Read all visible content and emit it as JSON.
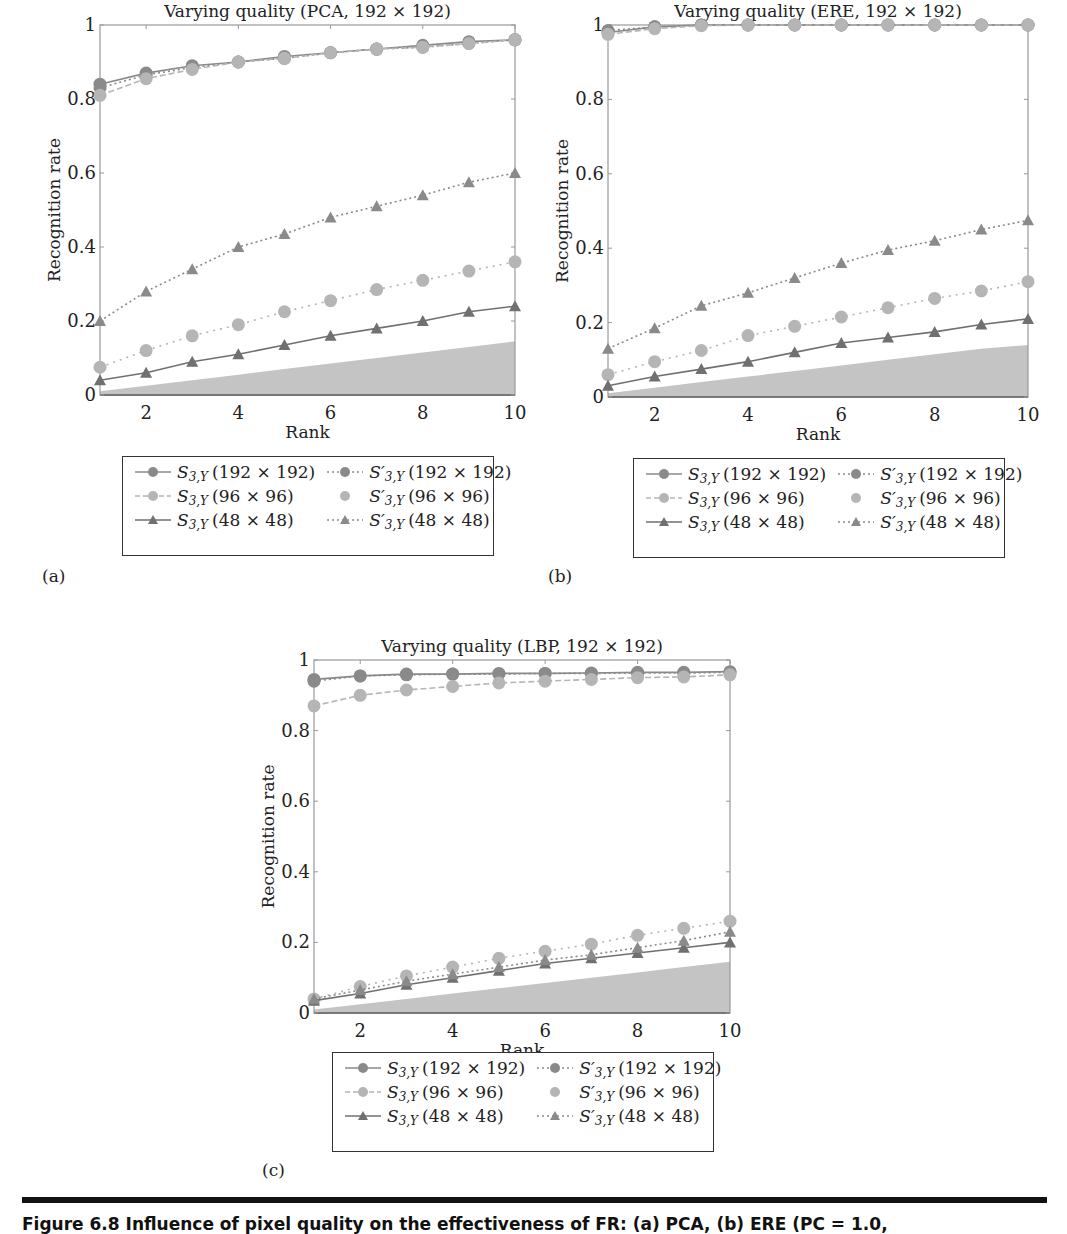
{
  "figure": {
    "caption": "Figure 6.8   Influence of pixel quality on the effectiveness of FR: (a) PCA, (b) ERE (PC = 1.0,",
    "rule_color": "#111111"
  },
  "panels": [
    {
      "id": "a",
      "label": "(a)",
      "title": "Varying quality (PCA, 192 × 192)",
      "xlabel": "Rank",
      "ylabel": "Recognition rate",
      "xticks": [
        "2",
        "4",
        "6",
        "8",
        "10"
      ],
      "yticks": [
        "0",
        "0.2",
        "0.4",
        "0.6",
        "0.8",
        "1"
      ]
    },
    {
      "id": "b",
      "label": "(b)",
      "title": "Varying quality (ERE, 192 × 192)",
      "xlabel": "Rank",
      "ylabel": "Recognition rate",
      "xticks": [
        "2",
        "4",
        "6",
        "8",
        "10"
      ],
      "yticks": [
        "0",
        "0.2",
        "0.4",
        "0.6",
        "0.8",
        "1"
      ]
    },
    {
      "id": "c",
      "label": "(c)",
      "title": "Varying quality (LBP, 192 × 192)",
      "xlabel": "Rank",
      "ylabel": "Recognition rate",
      "xticks": [
        "2",
        "4",
        "6",
        "8",
        "10"
      ],
      "yticks": [
        "0",
        "0.2",
        "0.4",
        "0.6",
        "0.8",
        "1"
      ]
    }
  ],
  "legend": {
    "items": [
      {
        "base": "S",
        "sub": "3,Y",
        "prime": "",
        "size": "(192 × 192)",
        "marker": "circle",
        "line": "solid",
        "color": "#8a8a8a"
      },
      {
        "base": "S",
        "sub": "3,Y",
        "prime": "′",
        "size": "(192 × 192)",
        "marker": "circle",
        "line": "dotted",
        "color": "#8a8a8a"
      },
      {
        "base": "S",
        "sub": "3,Y",
        "prime": "",
        "size": "(96 × 96)",
        "marker": "circle",
        "line": "dashed",
        "color": "#b5b5b5"
      },
      {
        "base": "S",
        "sub": "3,Y",
        "prime": "′",
        "size": "(96 × 96)",
        "marker": "circle",
        "line": "none",
        "color": "#b5b5b5"
      },
      {
        "base": "S",
        "sub": "3,Y",
        "prime": "",
        "size": "(48 × 48)",
        "marker": "triangle",
        "line": "solid",
        "color": "#707070"
      },
      {
        "base": "S",
        "sub": "3,Y",
        "prime": "′",
        "size": "(48 × 48)",
        "marker": "triangle",
        "line": "dotted",
        "color": "#8a8a8a"
      }
    ]
  },
  "chart_data": [
    {
      "type": "line",
      "title": "Varying quality (PCA, 192 × 192)",
      "xlabel": "Rank",
      "ylabel": "Recognition rate",
      "x": [
        1,
        2,
        3,
        4,
        5,
        6,
        7,
        8,
        9,
        10
      ],
      "xlim": [
        1,
        10
      ],
      "ylim": [
        0,
        1
      ],
      "xticks": [
        2,
        4,
        6,
        8,
        10
      ],
      "yticks": [
        0,
        0.2,
        0.4,
        0.6,
        0.8,
        1
      ],
      "grid": false,
      "legend_position": "below",
      "series": [
        {
          "name": "S3,Y (192×192)",
          "values": [
            0.84,
            0.87,
            0.89,
            0.9,
            0.915,
            0.925,
            0.935,
            0.945,
            0.955,
            0.96
          ]
        },
        {
          "name": "S3,Y (96×96)",
          "values": [
            0.83,
            0.865,
            0.885,
            0.9,
            0.91,
            0.925,
            0.935,
            0.94,
            0.95,
            0.96
          ]
        },
        {
          "name": "S3,Y (48×48)",
          "values": [
            0.81,
            0.855,
            0.88,
            0.9,
            0.91,
            0.925,
            0.935,
            0.94,
            0.95,
            0.96
          ]
        },
        {
          "name": "S'3,Y (192×192)",
          "values": [
            0.075,
            0.12,
            0.16,
            0.19,
            0.225,
            0.255,
            0.285,
            0.31,
            0.335,
            0.36
          ]
        },
        {
          "name": "S'3,Y (96×96)",
          "values": [
            0.04,
            0.06,
            0.09,
            0.11,
            0.135,
            0.16,
            0.18,
            0.2,
            0.225,
            0.24
          ]
        },
        {
          "name": "S'3,Y (48×48)",
          "values": [
            0.2,
            0.28,
            0.34,
            0.4,
            0.435,
            0.48,
            0.51,
            0.54,
            0.575,
            0.6
          ]
        },
        {
          "name": "random baseline (shaded area)",
          "values": [
            0.01,
            0.025,
            0.04,
            0.055,
            0.07,
            0.085,
            0.1,
            0.115,
            0.13,
            0.145
          ]
        }
      ]
    },
    {
      "type": "line",
      "title": "Varying quality (ERE, 192 × 192)",
      "xlabel": "Rank",
      "ylabel": "Recognition rate",
      "x": [
        1,
        2,
        3,
        4,
        5,
        6,
        7,
        8,
        9,
        10
      ],
      "xlim": [
        1,
        10
      ],
      "ylim": [
        0,
        1
      ],
      "xticks": [
        2,
        4,
        6,
        8,
        10
      ],
      "yticks": [
        0,
        0.2,
        0.4,
        0.6,
        0.8,
        1
      ],
      "grid": false,
      "legend_position": "below",
      "series": [
        {
          "name": "S3,Y (192×192)",
          "values": [
            0.98,
            0.995,
            1.0,
            1.0,
            1.0,
            1.0,
            1.0,
            1.0,
            1.0,
            1.0
          ]
        },
        {
          "name": "S3,Y (96×96)",
          "values": [
            0.985,
            0.995,
            1.0,
            1.0,
            1.0,
            1.0,
            1.0,
            1.0,
            1.0,
            1.0
          ]
        },
        {
          "name": "S3,Y (48×48)",
          "values": [
            0.975,
            0.99,
            0.998,
            1.0,
            1.0,
            1.0,
            1.0,
            1.0,
            1.0,
            1.0
          ]
        },
        {
          "name": "S'3,Y (192×192)",
          "values": [
            0.06,
            0.095,
            0.125,
            0.165,
            0.19,
            0.215,
            0.24,
            0.265,
            0.285,
            0.31
          ]
        },
        {
          "name": "S'3,Y (96×96)",
          "values": [
            0.03,
            0.055,
            0.075,
            0.095,
            0.12,
            0.145,
            0.16,
            0.175,
            0.195,
            0.21
          ]
        },
        {
          "name": "S'3,Y (48×48)",
          "values": [
            0.13,
            0.185,
            0.245,
            0.28,
            0.32,
            0.36,
            0.395,
            0.42,
            0.45,
            0.475
          ]
        },
        {
          "name": "random baseline (shaded area)",
          "values": [
            0.01,
            0.025,
            0.04,
            0.055,
            0.07,
            0.085,
            0.1,
            0.115,
            0.13,
            0.14
          ]
        }
      ]
    },
    {
      "type": "line",
      "title": "Varying quality (LBP, 192 × 192)",
      "xlabel": "Rank",
      "ylabel": "Recognition rate",
      "x": [
        1,
        2,
        3,
        4,
        5,
        6,
        7,
        8,
        9,
        10
      ],
      "xlim": [
        1,
        10
      ],
      "ylim": [
        0,
        1
      ],
      "xticks": [
        2,
        4,
        6,
        8,
        10
      ],
      "yticks": [
        0,
        0.2,
        0.4,
        0.6,
        0.8,
        1
      ],
      "grid": false,
      "legend_position": "below",
      "series": [
        {
          "name": "S3,Y (192×192)",
          "values": [
            0.945,
            0.955,
            0.96,
            0.96,
            0.962,
            0.962,
            0.963,
            0.965,
            0.965,
            0.967
          ]
        },
        {
          "name": "S3,Y (96×96)",
          "values": [
            0.94,
            0.955,
            0.958,
            0.96,
            0.96,
            0.962,
            0.962,
            0.963,
            0.963,
            0.965
          ]
        },
        {
          "name": "S3,Y (48×48)",
          "values": [
            0.87,
            0.9,
            0.915,
            0.925,
            0.935,
            0.94,
            0.945,
            0.95,
            0.952,
            0.958
          ]
        },
        {
          "name": "S'3,Y (192×192)",
          "values": [
            0.04,
            0.075,
            0.105,
            0.13,
            0.155,
            0.175,
            0.195,
            0.22,
            0.24,
            0.26
          ]
        },
        {
          "name": "S'3,Y (96×96)",
          "values": [
            0.035,
            0.055,
            0.08,
            0.1,
            0.12,
            0.14,
            0.155,
            0.17,
            0.185,
            0.2
          ]
        },
        {
          "name": "S'3,Y (48×48)",
          "values": [
            0.04,
            0.065,
            0.09,
            0.11,
            0.13,
            0.15,
            0.165,
            0.185,
            0.205,
            0.23
          ]
        },
        {
          "name": "random baseline (shaded area)",
          "values": [
            0.01,
            0.025,
            0.04,
            0.055,
            0.07,
            0.085,
            0.1,
            0.115,
            0.13,
            0.145
          ]
        }
      ]
    }
  ]
}
